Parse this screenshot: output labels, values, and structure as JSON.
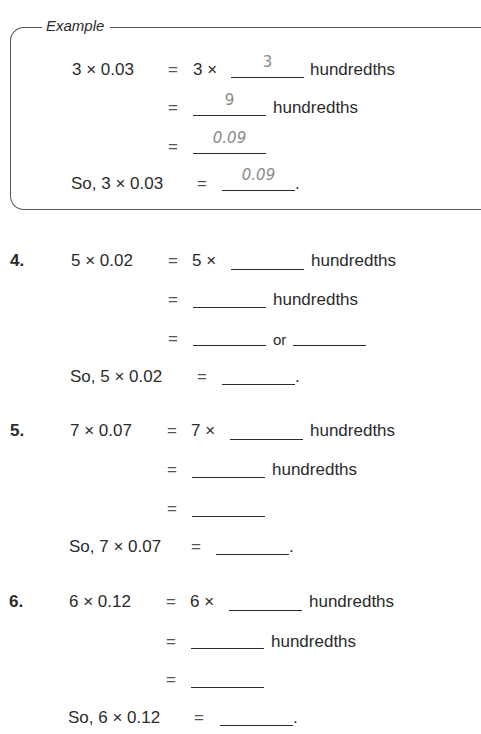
{
  "example": {
    "title": "Example",
    "rows": [
      {
        "lhs": "3 × 0.03",
        "eq": "=",
        "mid": "3 ×",
        "answer": "3",
        "unit": "hundredths"
      },
      {
        "eq": "=",
        "answer": "9",
        "unit": "hundredths"
      },
      {
        "eq": "=",
        "answer": "0.09"
      },
      {
        "lhs": "So, 3 × 0.03",
        "eq": "=",
        "answer": "0.09",
        "end": "."
      }
    ]
  },
  "problems": [
    {
      "number": "4.",
      "rows": [
        {
          "lhs": "5 × 0.02",
          "eq": "=",
          "mid": "5 ×",
          "unit": "hundredths"
        },
        {
          "eq": "=",
          "unit": "hundredths"
        },
        {
          "eq": "=",
          "or": "or"
        },
        {
          "lhs": "So, 5 × 0.02",
          "eq": "=",
          "end": "."
        }
      ]
    },
    {
      "number": "5.",
      "rows": [
        {
          "lhs": "7 × 0.07",
          "eq": "=",
          "mid": "7 ×",
          "unit": "hundredths"
        },
        {
          "eq": "=",
          "unit": "hundredths"
        },
        {
          "eq": "="
        },
        {
          "lhs": "So, 7 × 0.07",
          "eq": "=",
          "end": "."
        }
      ]
    },
    {
      "number": "6.",
      "rows": [
        {
          "lhs": "6 × 0.12",
          "eq": "=",
          "mid": "6 ×",
          "unit": "hundredths"
        },
        {
          "eq": "=",
          "unit": "hundredths"
        },
        {
          "eq": "="
        },
        {
          "lhs": "So, 6 × 0.12",
          "eq": "=",
          "end": "."
        }
      ]
    }
  ]
}
